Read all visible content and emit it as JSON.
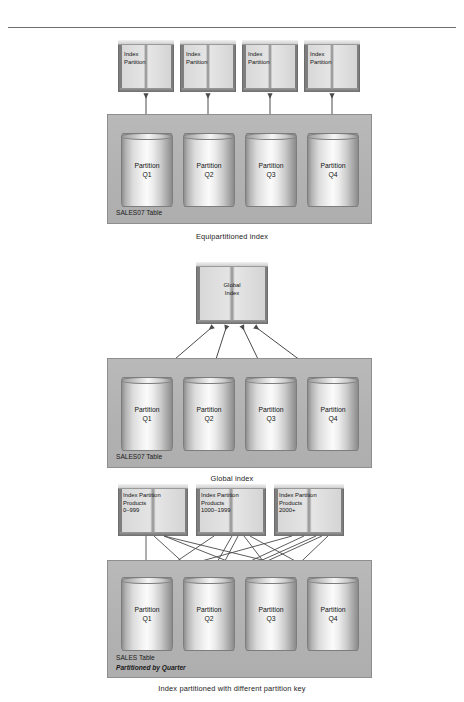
{
  "document": {
    "rule_visible": true
  },
  "figures": [
    {
      "id": "equipartitioned-index",
      "caption": "Equipartitioned index",
      "table": {
        "label": "SALES07 Table",
        "sublabel": "",
        "partitions": [
          {
            "line1": "Partition",
            "line2": "Q1"
          },
          {
            "line1": "Partition",
            "line2": "Q2"
          },
          {
            "line1": "Partition",
            "line2": "Q3"
          },
          {
            "line1": "Partition",
            "line2": "Q4"
          }
        ]
      },
      "indexes": [
        {
          "line1": "Index",
          "line2": "Partition",
          "line3": ""
        },
        {
          "line1": "Index",
          "line2": "Partition",
          "line3": ""
        },
        {
          "line1": "Index",
          "line2": "Partition",
          "line3": ""
        },
        {
          "line1": "Index",
          "line2": "Partition",
          "line3": ""
        }
      ],
      "arrow_style": "double-headed-vertical"
    },
    {
      "id": "global-index",
      "caption": "Global index",
      "table": {
        "label": "SALES07 Table",
        "sublabel": "",
        "partitions": [
          {
            "line1": "Partition",
            "line2": "Q1"
          },
          {
            "line1": "Partition",
            "line2": "Q2"
          },
          {
            "line1": "Partition",
            "line2": "Q3"
          },
          {
            "line1": "Partition",
            "line2": "Q4"
          }
        ]
      },
      "indexes": [
        {
          "line1": "Global",
          "line2": "Index",
          "line3": ""
        }
      ],
      "arrow_style": "fan-double-headed"
    },
    {
      "id": "index-partitioned-different-key",
      "caption": "Index partitioned with different partition key",
      "table": {
        "label": "SALES Table",
        "sublabel": "Partitioned by Quarter",
        "partitions": [
          {
            "line1": "Partition",
            "line2": "Q1"
          },
          {
            "line1": "Partition",
            "line2": "Q2"
          },
          {
            "line1": "Partition",
            "line2": "Q3"
          },
          {
            "line1": "Partition",
            "line2": "Q4"
          }
        ]
      },
      "indexes": [
        {
          "line1": "Index Partition",
          "line2": "Products",
          "line3": "0–999"
        },
        {
          "line1": "Index Partition",
          "line2": "Products",
          "line3": "1000–1999"
        },
        {
          "line1": "Index Partition",
          "line2": "Products",
          "line3": "2000+"
        }
      ],
      "arrow_style": "crossing-many-to-many"
    }
  ],
  "colors": {
    "table_box": "#b4b4b4",
    "table_border": "#8e8e8e",
    "cylinder_highlight": "#fbfbfb",
    "cylinder_edge": "#8b8b8b",
    "book_spine": "#7e7e7e",
    "arrow": "#4a4a4a",
    "rule": "#6f6f6f",
    "text": "#111111"
  }
}
